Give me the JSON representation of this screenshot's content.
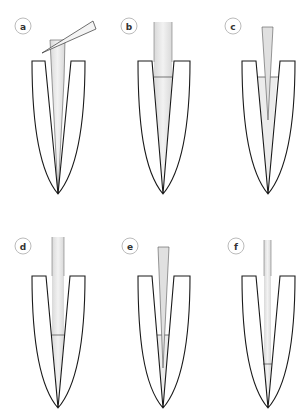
{
  "figure": {
    "panels": [
      {
        "label": "a",
        "step": "instrument-angled-entry"
      },
      {
        "label": "b",
        "step": "wide-instrument-inserted"
      },
      {
        "label": "c",
        "step": "tapered-cone-inserted"
      },
      {
        "label": "d",
        "step": "narrow-instrument-mid-depth"
      },
      {
        "label": "e",
        "step": "tapered-cone-deeper"
      },
      {
        "label": "f",
        "step": "fine-instrument-near-apex"
      }
    ],
    "colors": {
      "outline": "#1a1a1a",
      "instrument_fill": "#e6e6e6",
      "label_circle": "#bbbbbb"
    }
  }
}
